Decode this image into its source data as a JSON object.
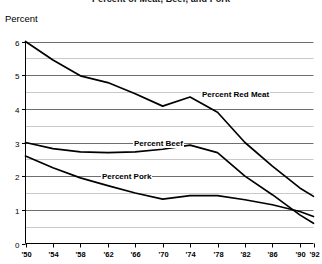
{
  "chart": {
    "title": "Percent of Meat, Beef, and Pork",
    "ylabel": "Percent",
    "series_labels": {
      "red_meat": "Percent Red Meat",
      "beef": "Percent Beef",
      "pork": "Percent Pork"
    }
  },
  "chart_data": {
    "type": "line",
    "title": "Percent of Meat, Beef, and Pork",
    "xlabel": "",
    "ylabel": "Percent",
    "xlim": [
      1950,
      1992
    ],
    "ylim": [
      0,
      6
    ],
    "grid": true,
    "minor_grid": true,
    "legend": "inline-annotations",
    "x_tick_labels": [
      "'50",
      "'54",
      "'58",
      "'62",
      "'66",
      "'70",
      "'74",
      "'78",
      "'82",
      "'86",
      "'90",
      "'92"
    ],
    "x_tick_values": [
      1950,
      1954,
      1958,
      1962,
      1966,
      1970,
      1974,
      1978,
      1982,
      1986,
      1990,
      1992
    ],
    "y_tick_labels": [
      "0",
      "1",
      "2",
      "3",
      "4",
      "5",
      "6"
    ],
    "y_tick_values": [
      0,
      1,
      2,
      3,
      4,
      5,
      6
    ],
    "y_minor_gridlines": [
      0.5,
      1.5,
      2.5,
      3.5,
      4.5,
      5.5
    ],
    "series": [
      {
        "name": "Percent Red Meat",
        "color": "#000000",
        "x": [
          1950,
          1954,
          1958,
          1962,
          1966,
          1970,
          1974,
          1978,
          1982,
          1986,
          1990,
          1992
        ],
        "values": [
          6.0,
          5.45,
          4.98,
          4.78,
          4.45,
          4.08,
          4.35,
          3.9,
          3.0,
          2.3,
          1.65,
          1.4
        ]
      },
      {
        "name": "Percent Beef",
        "color": "#000000",
        "x": [
          1950,
          1954,
          1958,
          1962,
          1966,
          1970,
          1974,
          1978,
          1982,
          1986,
          1990,
          1992
        ],
        "values": [
          3.0,
          2.82,
          2.72,
          2.7,
          2.72,
          2.8,
          2.92,
          2.7,
          2.0,
          1.45,
          0.85,
          0.6
        ]
      },
      {
        "name": "Percent Pork",
        "color": "#000000",
        "x": [
          1950,
          1954,
          1958,
          1962,
          1966,
          1970,
          1974,
          1978,
          1982,
          1986,
          1990,
          1992
        ],
        "values": [
          2.6,
          2.25,
          1.95,
          1.72,
          1.5,
          1.32,
          1.42,
          1.42,
          1.3,
          1.15,
          0.95,
          0.8
        ]
      }
    ]
  }
}
